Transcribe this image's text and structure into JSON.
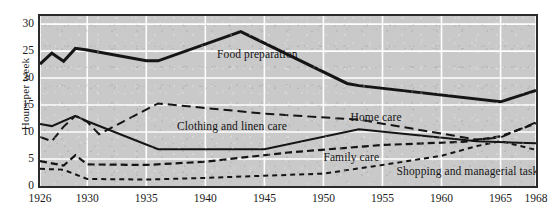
{
  "chart_data": {
    "type": "line",
    "title": "",
    "xlabel": "",
    "ylabel": "Hours per week",
    "xlim": [
      1926,
      1968
    ],
    "ylim": [
      0,
      31.5
    ],
    "grid": true,
    "legend_position": "inline-annotations",
    "xticks": [
      1926,
      1930,
      1935,
      1940,
      1945,
      1950,
      1955,
      1960,
      1965,
      1968
    ],
    "yticks": [
      0,
      5,
      10,
      15,
      20,
      25,
      30
    ],
    "series": [
      {
        "name": "Food preparation",
        "style": "thick-solid",
        "label_x": 1941.0,
        "label_y": 24.3,
        "x": [
          1926,
          1927,
          1928,
          1929,
          1930,
          1935,
          1936,
          1943,
          1952,
          1953,
          1965,
          1968
        ],
        "y": [
          22.6,
          24.6,
          23.1,
          25.5,
          25.2,
          23.2,
          23.2,
          28.6,
          19.0,
          18.6,
          15.6,
          17.7
        ]
      },
      {
        "name": "Home care",
        "style": "long-dash",
        "label_x": 1952.3,
        "label_y": 12.6,
        "x": [
          1926,
          1927,
          1928,
          1929,
          1930,
          1931,
          1936,
          1945,
          1953,
          1963,
          1965,
          1968
        ],
        "y": [
          9.1,
          8.3,
          11.0,
          13.0,
          11.9,
          9.6,
          15.3,
          13.4,
          12.3,
          8.6,
          9.0,
          11.8
        ]
      },
      {
        "name": "Clothing and linen care",
        "style": "solid",
        "label_x": 1937.6,
        "label_y": 10.9,
        "x": [
          1926,
          1927,
          1929,
          1930,
          1936,
          1945,
          1953,
          1963,
          1968
        ],
        "y": [
          11.5,
          11.1,
          13.0,
          12.0,
          6.8,
          6.8,
          10.5,
          8.3,
          7.9
        ]
      },
      {
        "name": "Family care",
        "style": "dash",
        "label_x": 1950.0,
        "label_y": 5.2,
        "x": [
          1926,
          1927,
          1928,
          1929,
          1930,
          1935,
          1940,
          1947,
          1955,
          1962,
          1965,
          1968
        ],
        "y": [
          4.6,
          4.2,
          3.8,
          5.7,
          4.0,
          3.9,
          4.5,
          6.2,
          7.6,
          8.2,
          9.2,
          11.6
        ]
      },
      {
        "name": "Shopping and managerial tasks",
        "style": "short-dash",
        "label_x": 1956.2,
        "label_y": 2.6,
        "x": [
          1926,
          1928,
          1930,
          1935,
          1940,
          1945,
          1950,
          1955,
          1960,
          1963,
          1965,
          1968
        ],
        "y": [
          3.2,
          3.0,
          1.3,
          1.2,
          1.5,
          1.9,
          2.3,
          3.9,
          5.6,
          7.4,
          8.3,
          6.7
        ]
      }
    ]
  }
}
